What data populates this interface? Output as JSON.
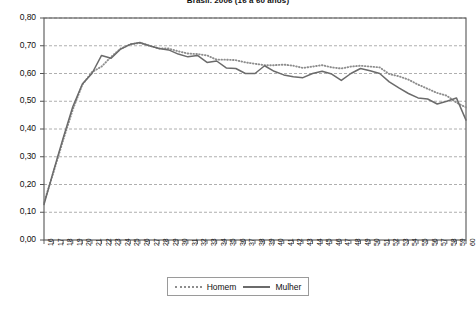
{
  "chart_data": {
    "type": "line",
    "title": "Brasil. 2006 (16 a 60 anos)",
    "xlabel": "",
    "ylabel": "",
    "xlim": [
      16,
      60
    ],
    "ylim": [
      0.0,
      0.8
    ],
    "grid": true,
    "grid_axis": "y",
    "legend_position": "bottom",
    "y_tick_labels": [
      "0,80",
      "0,70",
      "0,60",
      "0,50",
      "0,40",
      "0,30",
      "0,20",
      "0,10",
      "0,00"
    ],
    "y_tick_values": [
      0.8,
      0.7,
      0.6,
      0.5,
      0.4,
      0.3,
      0.2,
      0.1,
      0.0
    ],
    "categories": [
      16,
      17,
      18,
      19,
      20,
      21,
      22,
      23,
      24,
      25,
      26,
      27,
      28,
      29,
      30,
      31,
      32,
      33,
      34,
      35,
      36,
      37,
      38,
      39,
      40,
      41,
      42,
      43,
      44,
      45,
      46,
      47,
      48,
      49,
      50,
      51,
      52,
      53,
      54,
      55,
      56,
      57,
      58,
      59,
      60
    ],
    "x_tick_labels": [
      "16",
      "17",
      "18",
      "19",
      "20",
      "21",
      "22",
      "23",
      "24",
      "25",
      "26",
      "27",
      "28",
      "29",
      "30",
      "31",
      "32",
      "33",
      "34",
      "35",
      "36",
      "37",
      "38",
      "39",
      "40",
      "41",
      "42",
      "43",
      "44",
      "45",
      "46",
      "47",
      "48",
      "49",
      "50",
      "51",
      "52",
      "53",
      "54",
      "55",
      "56",
      "57",
      "58",
      "59",
      "60"
    ],
    "series": [
      {
        "name": "Homem",
        "style": "dotted",
        "color": "#8d8d8d",
        "values": [
          0.135,
          0.245,
          0.36,
          0.47,
          0.56,
          0.605,
          0.625,
          0.66,
          0.69,
          0.705,
          0.71,
          0.7,
          0.69,
          0.69,
          0.68,
          0.672,
          0.67,
          0.665,
          0.65,
          0.65,
          0.648,
          0.64,
          0.635,
          0.63,
          0.63,
          0.632,
          0.628,
          0.62,
          0.625,
          0.63,
          0.622,
          0.618,
          0.625,
          0.628,
          0.625,
          0.622,
          0.598,
          0.59,
          0.578,
          0.56,
          0.545,
          0.53,
          0.52,
          0.495,
          0.478
        ]
      },
      {
        "name": "Mulher",
        "style": "solid",
        "color": "#6b6b6b",
        "values": [
          0.128,
          0.25,
          0.368,
          0.48,
          0.562,
          0.6,
          0.665,
          0.655,
          0.688,
          0.705,
          0.712,
          0.7,
          0.69,
          0.685,
          0.67,
          0.66,
          0.665,
          0.64,
          0.645,
          0.62,
          0.618,
          0.6,
          0.6,
          0.628,
          0.608,
          0.595,
          0.588,
          0.585,
          0.6,
          0.608,
          0.598,
          0.575,
          0.6,
          0.618,
          0.61,
          0.6,
          0.57,
          0.548,
          0.528,
          0.512,
          0.508,
          0.49,
          0.5,
          0.512,
          0.432
        ]
      }
    ]
  },
  "legend": {
    "items": [
      {
        "label": "Homem",
        "style": "dotted"
      },
      {
        "label": "Mulher",
        "style": "solid"
      }
    ]
  },
  "colors": {
    "homem": "#8d8d8d",
    "mulher": "#6b6b6b",
    "axis": "#555555",
    "grid": "#9a9a9a",
    "background": "#ffffff"
  }
}
